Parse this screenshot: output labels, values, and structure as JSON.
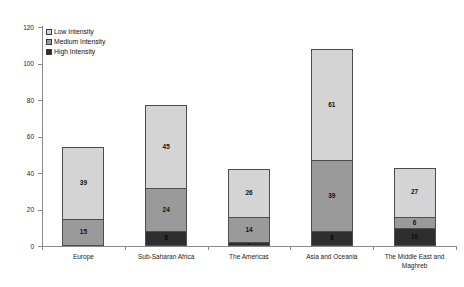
{
  "chart_data": {
    "type": "bar",
    "subtype": "stacked-vertical",
    "title": "",
    "xlabel": "",
    "ylabel": "",
    "ylim": [
      0,
      120
    ],
    "ytick_step": 20,
    "yticks": [
      0,
      20,
      40,
      60,
      80,
      100,
      120
    ],
    "grid": false,
    "legend_position": "top-left",
    "categories": [
      "Europe",
      "Sub-Saharan Africa",
      "The Americas",
      "Asia and Oceania",
      "The Middle East and Maghreb"
    ],
    "series": [
      {
        "name": "High Intensity",
        "color": "#2e2e2e",
        "values": [
          0,
          8,
          2,
          8,
          10
        ]
      },
      {
        "name": "Medium Intensity",
        "color": "#9a9a9a",
        "values": [
          15,
          24,
          14,
          39,
          6
        ]
      },
      {
        "name": "Low Intensity",
        "color": "#d4d4d4",
        "values": [
          39,
          45,
          26,
          61,
          27
        ]
      }
    ],
    "totals": [
      54,
      77,
      42,
      108,
      43
    ],
    "data_labels": {
      "Europe": {
        "low": "39",
        "medium": "15",
        "high": ""
      },
      "Sub-Saharan Africa": {
        "low": "45",
        "medium": "24",
        "high": "8"
      },
      "The Americas": {
        "low": "26",
        "medium": "14",
        "high": "2"
      },
      "Asia and Oceania": {
        "low": "61",
        "medium": "39",
        "high": "8"
      },
      "The Middle East and Maghreb": {
        "low": "27",
        "medium": "6",
        "high": "10"
      }
    }
  },
  "legend": {
    "items": [
      {
        "label": "Low Intensity",
        "color": "#d4d4d4"
      },
      {
        "label": "Medium Intensity",
        "color": "#9a9a9a"
      },
      {
        "label": "High Intensity",
        "color": "#2e2e2e"
      }
    ]
  },
  "axis": {
    "y_labels": [
      "120",
      "100",
      "80",
      "60",
      "40",
      "20",
      "0"
    ]
  },
  "colors": {
    "low": "#d4d4d4",
    "medium": "#9a9a9a",
    "high": "#2e2e2e",
    "axis": "#8a8a8a",
    "bar_outline": "#4d4d4d",
    "background": "#ffffff"
  }
}
